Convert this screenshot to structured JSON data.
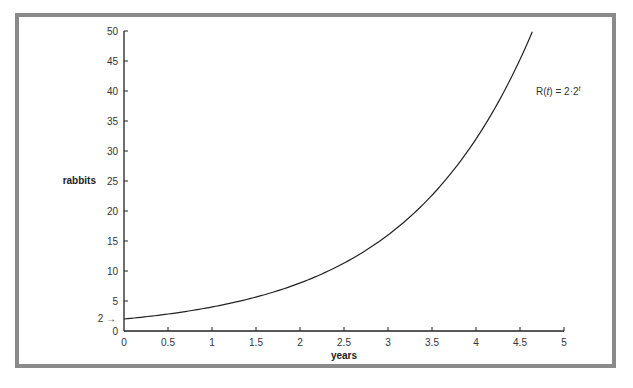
{
  "chart_data": {
    "type": "line",
    "title": "",
    "xlabel": "years",
    "ylabel": "rabbits",
    "xlim": [
      0,
      5
    ],
    "ylim": [
      0,
      50
    ],
    "x_ticks": [
      "0",
      "0.5",
      "1",
      "1.5",
      "2",
      "2.5",
      "3",
      "3.5",
      "4",
      "4.5",
      "5"
    ],
    "y_ticks": [
      "0",
      "5",
      "10",
      "15",
      "20",
      "25",
      "30",
      "35",
      "40",
      "45",
      "50"
    ],
    "grid": false,
    "legend": null,
    "annotations": [
      {
        "text": "2 →",
        "target": {
          "x": 0,
          "y": 2
        },
        "note": "initial value marker"
      },
      {
        "text": "R(t) = 2·2^t",
        "position": {
          "x": 4.2,
          "y": 42
        }
      }
    ],
    "series": [
      {
        "name": "R(t) = 2·2^t",
        "function": "2*2^t",
        "x": [
          0,
          0.5,
          1,
          1.5,
          2,
          2.5,
          3,
          3.5,
          4,
          4.5,
          4.64
        ],
        "y": [
          2,
          2.83,
          4,
          5.66,
          8,
          11.31,
          16,
          22.63,
          32,
          45.25,
          49.9
        ]
      }
    ]
  },
  "labels": {
    "xlabel": "years",
    "ylabel": "rabbits",
    "initial_marker": "2 →",
    "equation_prefix": "R(",
    "equation_var": "t",
    "equation_mid": ") = 2·2",
    "equation_sup": "t"
  }
}
